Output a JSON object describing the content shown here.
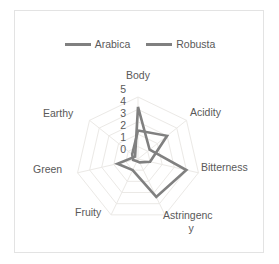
{
  "legend": {
    "position": "top-center",
    "entries": [
      {
        "label": "Arabica",
        "color": "#808080"
      },
      {
        "label": "Robusta",
        "color": "#808080"
      }
    ]
  },
  "axis": {
    "radial_ticks": [
      "5",
      "4",
      "3",
      "2",
      "1",
      "0"
    ],
    "radial_min": 0,
    "radial_max": 5
  },
  "categories": {
    "body": "Body",
    "acidity": "Acidity",
    "bitterness": "Bitterness",
    "astringency_line1": "Astringenc",
    "astringency_line2": "y",
    "fruity": "Fruity",
    "green": "Green",
    "earthy": "Earthy"
  },
  "chart_data": {
    "type": "radar",
    "title": "",
    "subtitle": "",
    "xlabel": "",
    "ylabel": "",
    "categories": [
      "Body",
      "Acidity",
      "Bitterness",
      "Astringency",
      "Fruity",
      "Green",
      "Earthy"
    ],
    "rlim": [
      0,
      5
    ],
    "rticks": [
      0,
      1,
      2,
      3,
      4,
      5
    ],
    "grid": true,
    "legend_position": "top-center",
    "series": [
      {
        "name": "Arabica",
        "color": "#808080",
        "values": [
          2.3,
          3.0,
          1.0,
          0.3,
          0.2,
          0.4,
          0.6
        ]
      },
      {
        "name": "Robusta",
        "color": "#808080",
        "values": [
          4.2,
          1.2,
          4.0,
          3.4,
          1.0,
          1.7,
          0.3
        ]
      }
    ]
  }
}
